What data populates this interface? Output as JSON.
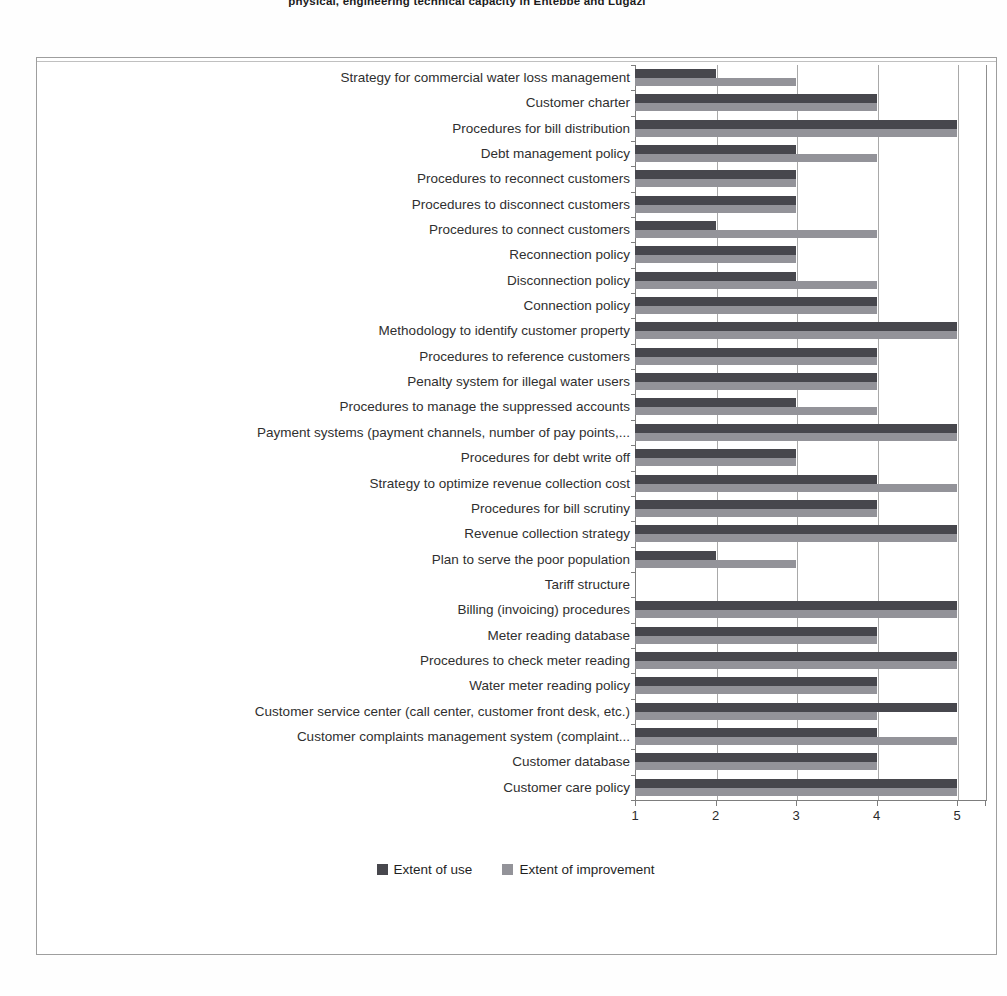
{
  "page": {
    "caption_fragment": "physical, engineering technical capacity in Entebbe and Lugazi"
  },
  "chart_data": {
    "type": "bar",
    "orientation": "horizontal",
    "title": "",
    "xlabel": "",
    "ylabel": "",
    "xlim": [
      1,
      5
    ],
    "x_ticks": [
      1,
      2,
      3,
      4,
      5
    ],
    "grid": "vertical",
    "legend_position": "bottom",
    "categories": [
      "Strategy for commercial water loss management",
      "Customer charter",
      "Procedures for bill distribution",
      "Debt management policy",
      "Procedures to reconnect customers",
      "Procedures to disconnect customers",
      "Procedures to connect customers",
      "Reconnection policy",
      "Disconnection policy",
      "Connection policy",
      "Methodology to identify customer property",
      "Procedures to reference customers",
      "Penalty system  for illegal water users",
      "Procedures to manage the suppressed accounts",
      "Payment systems (payment channels, number of pay points,...",
      "Procedures for debt write off",
      "Strategy to optimize revenue collection cost",
      "Procedures for bill scrutiny",
      "Revenue collection strategy",
      "Plan to serve the poor population",
      "Tariff structure",
      "Billing (invoicing) procedures",
      "Meter reading database",
      "Procedures to check meter reading",
      "Water meter reading policy",
      "Customer service center (call center, customer front desk, etc.)",
      "Customer complaints management system (complaint...",
      "Customer database",
      "Customer care policy"
    ],
    "series": [
      {
        "name": "Extent of use",
        "color": "#47474d",
        "values": [
          2,
          4,
          5,
          3,
          3,
          3,
          2,
          3,
          3,
          4,
          5,
          4,
          4,
          3,
          5,
          3,
          4,
          4,
          5,
          2,
          1,
          5,
          4,
          5,
          4,
          5,
          4,
          4,
          5
        ]
      },
      {
        "name": "Extent of improvement",
        "color": "#939399",
        "values": [
          3,
          4,
          5,
          4,
          3,
          3,
          4,
          3,
          4,
          4,
          5,
          4,
          4,
          4,
          5,
          3,
          5,
          4,
          5,
          3,
          1,
          5,
          4,
          5,
          4,
          4,
          5,
          4,
          5
        ]
      }
    ]
  }
}
